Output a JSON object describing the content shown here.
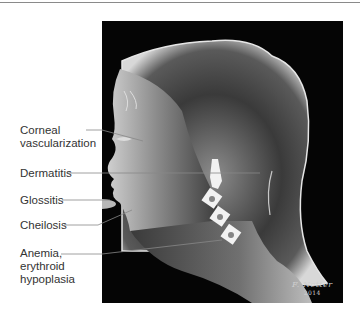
{
  "figure": {
    "background_color": "#050505",
    "labels": [
      {
        "id": "corneal",
        "line1": "Corneal",
        "line2": "vascularization"
      },
      {
        "id": "dermatitis",
        "line1": "Dermatitis"
      },
      {
        "id": "glossitis",
        "line1": "Glossitis"
      },
      {
        "id": "cheilosis",
        "line1": "Cheilosis"
      },
      {
        "id": "anemia",
        "line1": "Anemia,",
        "line2": "erythroid",
        "line3": "hypoplasia"
      }
    ],
    "signature": {
      "name": "F. Netter",
      "year": "2014"
    }
  }
}
